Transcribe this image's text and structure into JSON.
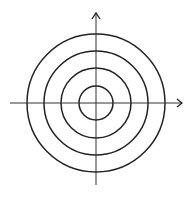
{
  "diagram": {
    "type": "concentric-circles-with-axes",
    "center": {
      "x": 96,
      "y": 103
    },
    "circles": [
      {
        "r": 17
      },
      {
        "r": 35
      },
      {
        "r": 52
      },
      {
        "r": 69
      }
    ],
    "axes": {
      "horizontal": {
        "x1": 10,
        "x2": 182,
        "y": 103,
        "arrow": "right"
      },
      "vertical": {
        "x": 96,
        "y1": 185,
        "y2": 13,
        "arrow": "up"
      }
    },
    "colors": {
      "stroke": "#222222",
      "axis": "#333333",
      "background": "#ffffff"
    }
  }
}
